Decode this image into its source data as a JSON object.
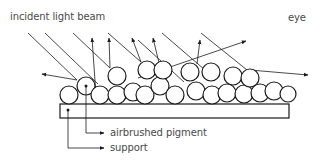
{
  "labels": {
    "incident": "incident light beam",
    "eye": "eye",
    "pigment": "airbrushed pigment",
    "support": "support"
  },
  "colors": {
    "line": "#1a1a1a",
    "text": "#4a4a4a",
    "background": "#ffffff"
  },
  "diagram": {
    "support_rect": {
      "x": 60,
      "y": 104,
      "width": 229,
      "height": 14
    },
    "pigment_particles": [
      {
        "cx": 69,
        "cy": 95,
        "r": 9
      },
      {
        "cx": 86,
        "cy": 86,
        "r": 9
      },
      {
        "cx": 100,
        "cy": 95,
        "r": 9
      },
      {
        "cx": 117,
        "cy": 95,
        "r": 9
      },
      {
        "cx": 117,
        "cy": 76,
        "r": 9
      },
      {
        "cx": 133,
        "cy": 92,
        "r": 9
      },
      {
        "cx": 147,
        "cy": 70,
        "r": 9
      },
      {
        "cx": 145,
        "cy": 95,
        "r": 9
      },
      {
        "cx": 160,
        "cy": 86,
        "r": 9
      },
      {
        "cx": 163,
        "cy": 70,
        "r": 9
      },
      {
        "cx": 175,
        "cy": 95,
        "r": 9
      },
      {
        "cx": 190,
        "cy": 72,
        "r": 9
      },
      {
        "cx": 196,
        "cy": 91,
        "r": 9
      },
      {
        "cx": 211,
        "cy": 72,
        "r": 9
      },
      {
        "cx": 212,
        "cy": 95,
        "r": 9
      },
      {
        "cx": 227,
        "cy": 93,
        "r": 9
      },
      {
        "cx": 233,
        "cy": 76,
        "r": 9
      },
      {
        "cx": 244,
        "cy": 94,
        "r": 9
      },
      {
        "cx": 250,
        "cy": 78,
        "r": 9
      },
      {
        "cx": 260,
        "cy": 93,
        "r": 9
      },
      {
        "cx": 274,
        "cy": 91,
        "r": 9
      },
      {
        "cx": 288,
        "cy": 94,
        "r": 8
      }
    ],
    "incident_rays": [
      {
        "x1": 28,
        "y1": 33,
        "x2": 77,
        "y2": 80
      },
      {
        "x1": 45,
        "y1": 33,
        "x2": 98,
        "y2": 84
      },
      {
        "x1": 73,
        "y1": 33,
        "x2": 110,
        "y2": 68
      },
      {
        "x1": 108,
        "y1": 33,
        "x2": 141,
        "y2": 62
      },
      {
        "x1": 138,
        "y1": 40,
        "x2": 184,
        "y2": 82
      },
      {
        "x1": 162,
        "y1": 33,
        "x2": 205,
        "y2": 70
      },
      {
        "x1": 201,
        "y1": 33,
        "x2": 247,
        "y2": 70
      }
    ],
    "reflected_rays": [
      {
        "x1": 77,
        "y1": 80,
        "x2": 42,
        "y2": 74
      },
      {
        "x1": 96,
        "y1": 95,
        "x2": 92,
        "y2": 38
      },
      {
        "x1": 110,
        "y1": 68,
        "x2": 109,
        "y2": 38
      },
      {
        "x1": 141,
        "y1": 62,
        "x2": 132,
        "y2": 38
      },
      {
        "x1": 160,
        "y1": 67,
        "x2": 153,
        "y2": 38
      },
      {
        "x1": 138,
        "y1": 78,
        "x2": 246,
        "y2": 41
      },
      {
        "x1": 197,
        "y1": 64,
        "x2": 200,
        "y2": 40
      },
      {
        "x1": 250,
        "y1": 70,
        "x2": 308,
        "y2": 75
      }
    ],
    "leader_pigment": {
      "points": "86,86 86,133 104,133"
    },
    "leader_support": {
      "points": "68,110 68,148 104,148"
    }
  }
}
